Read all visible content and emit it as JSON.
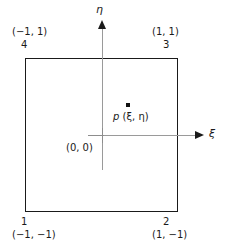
{
  "figure": {
    "type": "diagram",
    "axes": {
      "horizontal": {
        "label": "ξ",
        "name": "xi-axis"
      },
      "vertical": {
        "label": "η",
        "name": "eta-axis"
      }
    },
    "origin": {
      "label": "(0, 0)"
    },
    "interior_point": {
      "name": "p",
      "coords": "(ξ, η)",
      "label": "p (ξ, η)"
    },
    "corners": [
      {
        "node": "1",
        "coords": "(−1, −1)",
        "position": "bottom-left"
      },
      {
        "node": "2",
        "coords": "(1, −1)",
        "position": "bottom-right"
      },
      {
        "node": "3",
        "coords": "(1, 1)",
        "position": "top-right"
      },
      {
        "node": "4",
        "coords": "(−1, 1)",
        "position": "top-left"
      }
    ],
    "colors": {
      "outline": "#1a1a1a",
      "axis": "#9a9a9a",
      "text": "#1a1a1a",
      "background": "#ffffff"
    }
  }
}
